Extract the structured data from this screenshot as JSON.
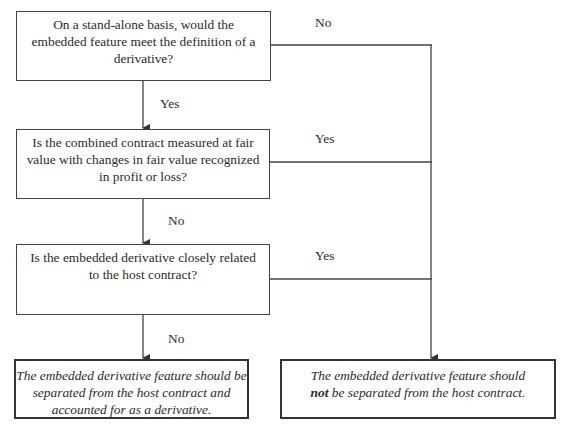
{
  "questions": [
    {
      "text": "On a stand-alone basis, would the embedded feature meet the definition of a derivative?",
      "line1": "On a stand-alone basis, would the",
      "line2": "embedded feature meet the definition of a",
      "line3": "derivative?"
    },
    {
      "text": "Is the combined contract measured at fair value with changes in fair value recognized in profit or loss?",
      "line1": "Is the combined contract measured at fair",
      "line2": "value with changes in fair value recognized",
      "line3": "in profit or loss?"
    },
    {
      "text": "Is the embedded derivative closely related to the host contract?",
      "line1": "Is the embedded derivative closely related",
      "line2": "to the host contract?"
    }
  ],
  "outcomes": {
    "separate": {
      "line1": "The embedded derivative feature should be",
      "line2": "separated from the host contract and",
      "line3": "accounted for as a derivative."
    },
    "not_separate": {
      "line1": "The embedded derivative feature should",
      "bold": "not",
      "line2_rest": " be separated from the host contract."
    }
  },
  "labels": {
    "q1_down": "Yes",
    "q1_right": "No",
    "q2_down": "No",
    "q2_right": "Yes",
    "q3_down": "No",
    "q3_right": "Yes"
  },
  "colors": {
    "line": "#444444",
    "text": "#2a2a2a",
    "background": "#ffffff"
  }
}
